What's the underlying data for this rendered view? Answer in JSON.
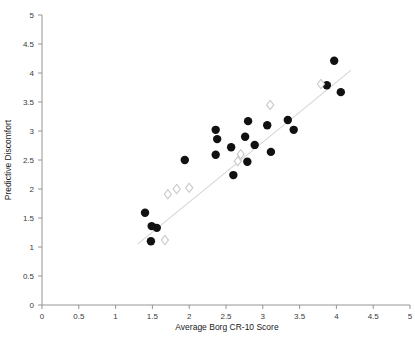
{
  "chart_data": {
    "type": "scatter",
    "title": "",
    "xlabel": "Average Borg CR-10 Score",
    "ylabel": "Predictive Discomfort",
    "xlim": [
      0,
      5
    ],
    "ylim": [
      0,
      5
    ],
    "xticks": [
      "0",
      "0.5",
      "1",
      "1.5",
      "2",
      "2.5",
      "3",
      "3.5",
      "4",
      "4.5",
      "5"
    ],
    "yticks": [
      "0",
      "0.5",
      "1",
      "1.5",
      "2",
      "2.5",
      "3",
      "3.5",
      "4",
      "4.5",
      "5"
    ],
    "xtick_values": [
      0,
      0.5,
      1,
      1.5,
      2,
      2.5,
      3,
      3.5,
      4,
      4.5,
      5
    ],
    "ytick_values": [
      0,
      0.5,
      1,
      1.5,
      2,
      2.5,
      3,
      3.5,
      4,
      4.5,
      5
    ],
    "grid": false,
    "legend": "none",
    "marker_color_filled": "#111111",
    "marker_color_open": "#ffffff",
    "marker_edge_open": "#c9c9c9",
    "trendline_color": "#d6d6d6",
    "axis_color": "#8a8a8a",
    "series": [
      {
        "name": "Measured (filled circle)",
        "marker": "filled-circle",
        "points": [
          [
            1.4,
            1.59
          ],
          [
            1.49,
            1.36
          ],
          [
            1.56,
            1.33
          ],
          [
            1.48,
            1.1
          ],
          [
            1.94,
            2.5
          ],
          [
            2.36,
            3.02
          ],
          [
            2.38,
            2.86
          ],
          [
            2.36,
            2.59
          ],
          [
            2.57,
            2.72
          ],
          [
            2.6,
            2.24
          ],
          [
            2.76,
            2.9
          ],
          [
            2.79,
            2.47
          ],
          [
            2.8,
            3.17
          ],
          [
            2.89,
            2.76
          ],
          [
            3.06,
            3.1
          ],
          [
            3.11,
            2.64
          ],
          [
            3.34,
            3.19
          ],
          [
            3.42,
            3.02
          ],
          [
            3.87,
            3.79
          ],
          [
            3.97,
            4.21
          ],
          [
            4.06,
            3.67
          ]
        ]
      },
      {
        "name": "Model (open diamond)",
        "marker": "open-diamond",
        "points": [
          [
            1.67,
            1.12
          ],
          [
            1.71,
            1.91
          ],
          [
            1.83,
            2.0
          ],
          [
            2.0,
            2.02
          ],
          [
            2.66,
            2.48
          ],
          [
            2.7,
            2.6
          ],
          [
            3.1,
            3.45
          ],
          [
            3.79,
            3.81
          ]
        ]
      }
    ],
    "trendline": {
      "name": "regression-line",
      "x": [
        1.3,
        4.2
      ],
      "y": [
        1.05,
        4.05
      ]
    }
  },
  "axes": {
    "x_title": "Average Borg CR-10 Score",
    "y_title": "Predictive Discomfort"
  }
}
